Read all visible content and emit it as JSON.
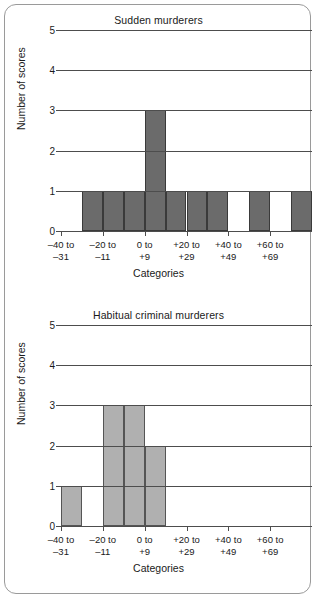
{
  "figure": {
    "y_axis_label": "Number of scores",
    "x_axis_label": "Categories",
    "y_ticks": [
      "0",
      "1",
      "2",
      "3",
      "4",
      "5"
    ],
    "x_tick_labels": [
      {
        "line1": "–40 to",
        "line2": "–31"
      },
      {
        "line1": "–20 to",
        "line2": "–11"
      },
      {
        "line1": "0 to",
        "line2": "+9"
      },
      {
        "line1": "+20 to",
        "line2": "+29"
      },
      {
        "line1": "+40 to",
        "line2": "+49"
      },
      {
        "line1": "+60 to",
        "line2": "+69"
      }
    ],
    "colors": {
      "bar_dark": "#6b6b6b",
      "bar_light": "#b0b0b0",
      "axis": "#4d4d4d",
      "frame": "#9a9a9a",
      "text": "#1a1a1a"
    }
  },
  "chart_data": [
    {
      "type": "bar",
      "title": "Sudden murderers",
      "xlabel": "Categories",
      "ylabel": "Number of scores",
      "ylim": [
        0,
        5
      ],
      "grid": true,
      "bar_color": "#6b6b6b",
      "bin_width": 10,
      "categories": [
        "–40 to –31",
        "–30 to –21",
        "–20 to –11",
        "–10 to –1",
        "0 to +9",
        "+10 to +19",
        "+20 to +29",
        "+30 to +39",
        "+40 to +49",
        "+50 to +59",
        "+60 to +69",
        "+70 to +79"
      ],
      "values": [
        0,
        1,
        1,
        1,
        3,
        1,
        1,
        1,
        0,
        1,
        0,
        1
      ],
      "tick_categories": [
        "–40 to –31",
        "–20 to –11",
        "0 to +9",
        "+20 to +29",
        "+40 to +49",
        "+60 to +69"
      ]
    },
    {
      "type": "bar",
      "title": "Habitual criminal murderers",
      "xlabel": "Categories",
      "ylabel": "Number of scores",
      "ylim": [
        0,
        5
      ],
      "grid": true,
      "bar_color": "#b0b0b0",
      "bin_width": 10,
      "categories": [
        "–40 to –31",
        "–30 to –21",
        "–20 to –11",
        "–10 to –1",
        "0 to +9",
        "+10 to +19",
        "+20 to +29",
        "+30 to +39",
        "+40 to +49",
        "+50 to +59",
        "+60 to +69",
        "+70 to +79"
      ],
      "values": [
        1,
        0,
        3,
        3,
        2,
        0,
        0,
        0,
        0,
        0,
        0,
        0
      ],
      "tick_categories": [
        "–40 to –31",
        "–20 to –11",
        "0 to +9",
        "+20 to +29",
        "+40 to +49",
        "+60 to +69"
      ]
    }
  ]
}
